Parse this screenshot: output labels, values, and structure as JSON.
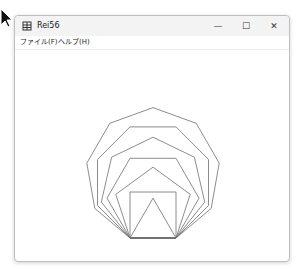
{
  "window": {
    "title": "Rei56",
    "controls": {
      "minimize": "—",
      "maximize": "☐",
      "close": "✕"
    }
  },
  "menubar": {
    "items": [
      {
        "label": "ファイル(F)"
      },
      {
        "label": "ヘルプ(H)"
      }
    ]
  },
  "drawing": {
    "base_left": [
      130,
      238
    ],
    "base_right": [
      176,
      238
    ],
    "min_sides": 3,
    "max_sides": 9,
    "stroke": "#6e6e6e"
  }
}
